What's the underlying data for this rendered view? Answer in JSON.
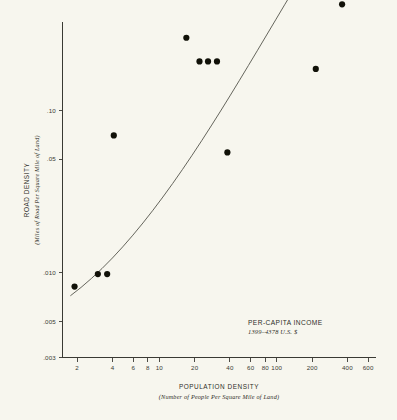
{
  "figure": {
    "background_color": "#f7f6ee",
    "ink_color": "#2b2b2b"
  },
  "annotation": {
    "line1": "PER-CAPITA INCOME",
    "line2": "1399–4378 U.S. $"
  },
  "chart_data": {
    "type": "scatter",
    "title": "",
    "xlabel": "POPULATION DENSITY",
    "xlabel_sub": "(Number of People Per Square Mile of Land)",
    "ylabel": "ROAD DENSITY",
    "ylabel_sub": "(Miles of Road Per Square Mile of Land)",
    "xscale": "log",
    "yscale": "log",
    "xlim": [
      1.5,
      700
    ],
    "ylim": [
      0.003,
      0.35
    ],
    "grid": false,
    "legend": false,
    "xticks": [
      2,
      4,
      6,
      8,
      10,
      20,
      40,
      60,
      80,
      100,
      200,
      400,
      600
    ],
    "xtick_labels": [
      "2",
      "4",
      "6",
      "8",
      "10",
      "20",
      "40",
      "60",
      "80",
      "100",
      "200",
      "400",
      "600"
    ],
    "yticks": [
      0.003,
      0.005,
      0.01,
      0.05,
      0.1,
      0.5,
      1,
      3
    ],
    "ytick_labels": [
      ".003",
      ".005",
      ".010",
      ".05",
      ".10",
      ".5",
      "1",
      "3"
    ],
    "points": [
      {
        "x": 1.9,
        "y": 0.0082
      },
      {
        "x": 3.0,
        "y": 0.0098
      },
      {
        "x": 3.6,
        "y": 0.0098
      },
      {
        "x": 4.1,
        "y": 0.07
      },
      {
        "x": 17.0,
        "y": 0.28
      },
      {
        "x": 22.0,
        "y": 0.2
      },
      {
        "x": 26.0,
        "y": 0.2
      },
      {
        "x": 31.0,
        "y": 0.2
      },
      {
        "x": 38.0,
        "y": 0.055
      },
      {
        "x": 190.0,
        "y": 2.0
      },
      {
        "x": 215.0,
        "y": 0.18
      },
      {
        "x": 240.0,
        "y": 1.1
      },
      {
        "x": 265.0,
        "y": 1.15
      },
      {
        "x": 300.0,
        "y": 0.75
      },
      {
        "x": 320.0,
        "y": 1.3
      },
      {
        "x": 340.0,
        "y": 0.95
      },
      {
        "x": 360.0,
        "y": 0.45
      },
      {
        "x": 400.0,
        "y": 1.0
      },
      {
        "x": 430.0,
        "y": 1.9
      },
      {
        "x": 470.0,
        "y": 2.3
      },
      {
        "x": 500.0,
        "y": 2.5
      },
      {
        "x": 520.0,
        "y": 1.6
      },
      {
        "x": 540.0,
        "y": 0.7
      },
      {
        "x": 600.0,
        "y": 2.2
      }
    ],
    "trend_line": {
      "description": "fitted curve",
      "x_start": 1.75,
      "y_start": 0.0072,
      "x_end": 640,
      "y_end": 3.0
    }
  }
}
